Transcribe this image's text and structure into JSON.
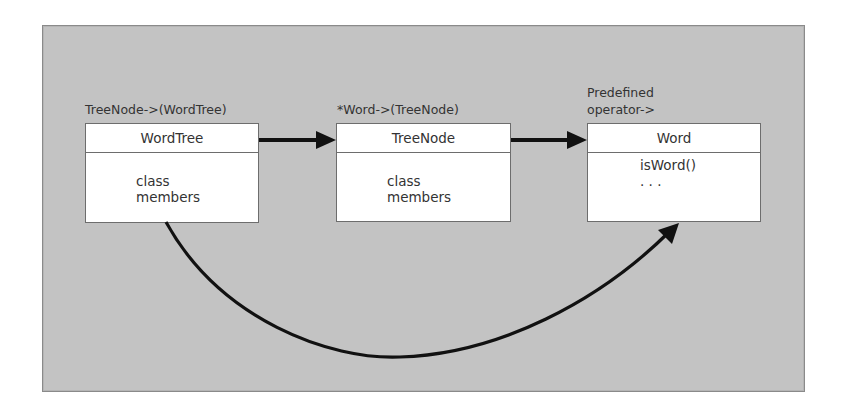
{
  "diagram": {
    "type": "class-relationship",
    "nodes": [
      {
        "id": "wordtree",
        "caption": "TreeNode->(WordTree)",
        "title": "WordTree",
        "members": [
          "class",
          "members"
        ]
      },
      {
        "id": "treenode",
        "caption": "*Word->(TreeNode)",
        "title": "TreeNode",
        "members": [
          "class",
          "members"
        ]
      },
      {
        "id": "word",
        "caption_lines": [
          "Predefined",
          "operator->"
        ],
        "title": "Word",
        "members": [
          "isWord()",
          ". . ."
        ]
      }
    ],
    "edges": [
      {
        "from": "wordtree",
        "to": "treenode",
        "style": "straight-arrow"
      },
      {
        "from": "treenode",
        "to": "word",
        "style": "straight-arrow"
      },
      {
        "from": "wordtree",
        "to": "word",
        "style": "curved-arrow-below"
      }
    ],
    "colors": {
      "background": "#c3c3c3",
      "box_fill": "#ffffff",
      "box_border": "#6d6d6d",
      "arrow": "#111111"
    }
  }
}
